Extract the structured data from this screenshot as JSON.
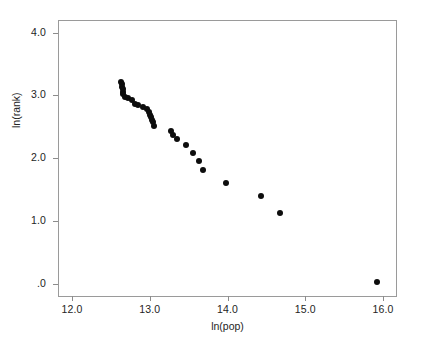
{
  "figure": {
    "background_color": "#ffffff",
    "frame_color": "#9a9a9a",
    "point_color": "#0d0d0d"
  },
  "chart_data": {
    "type": "scatter",
    "title": "",
    "xlabel": "ln(pop)",
    "ylabel": "ln(rank)",
    "xlim": [
      11.82,
      16.18
    ],
    "ylim": [
      -0.21,
      4.2
    ],
    "xticks": [
      12.0,
      13.0,
      14.0,
      15.0,
      16.0
    ],
    "xtick_labels": [
      "12.0",
      "13.0",
      "14.0",
      "15.0",
      "16.0"
    ],
    "yticks": [
      0.0,
      1.0,
      2.0,
      3.0,
      4.0
    ],
    "ytick_labels": [
      ".0",
      "1.0",
      "2.0",
      "3.0",
      "4.0"
    ],
    "grid": false,
    "legend": null,
    "marker": "filled-circle",
    "marker_size_px": 6,
    "n_points": 30,
    "x": [
      12.63,
      12.64,
      12.64,
      12.65,
      12.66,
      12.66,
      12.68,
      12.72,
      12.77,
      12.81,
      12.85,
      12.91,
      12.96,
      12.99,
      13.0,
      13.02,
      13.03,
      13.04,
      13.05,
      13.27,
      13.3,
      13.35,
      13.46,
      13.55,
      13.63,
      13.69,
      13.98,
      14.43,
      14.67,
      15.92
    ],
    "y": [
      3.22,
      3.18,
      3.14,
      3.1,
      3.06,
      3.02,
      2.98,
      2.96,
      2.92,
      2.87,
      2.85,
      2.81,
      2.78,
      2.73,
      2.69,
      2.65,
      2.61,
      2.57,
      2.52,
      2.43,
      2.37,
      2.31,
      2.21,
      2.09,
      1.96,
      1.81,
      1.61,
      1.4,
      1.12,
      0.03
    ],
    "points": [
      {
        "x": 12.63,
        "y": 3.22
      },
      {
        "x": 12.64,
        "y": 3.18
      },
      {
        "x": 12.64,
        "y": 3.14
      },
      {
        "x": 12.65,
        "y": 3.1
      },
      {
        "x": 12.66,
        "y": 3.06
      },
      {
        "x": 12.66,
        "y": 3.02
      },
      {
        "x": 12.68,
        "y": 2.98
      },
      {
        "x": 12.72,
        "y": 2.96
      },
      {
        "x": 12.77,
        "y": 2.92
      },
      {
        "x": 12.81,
        "y": 2.87
      },
      {
        "x": 12.85,
        "y": 2.85
      },
      {
        "x": 12.91,
        "y": 2.81
      },
      {
        "x": 12.96,
        "y": 2.78
      },
      {
        "x": 12.99,
        "y": 2.73
      },
      {
        "x": 13.0,
        "y": 2.69
      },
      {
        "x": 13.02,
        "y": 2.65
      },
      {
        "x": 13.03,
        "y": 2.61
      },
      {
        "x": 13.04,
        "y": 2.57
      },
      {
        "x": 13.05,
        "y": 2.52
      },
      {
        "x": 13.27,
        "y": 2.43
      },
      {
        "x": 13.3,
        "y": 2.37
      },
      {
        "x": 13.35,
        "y": 2.31
      },
      {
        "x": 13.46,
        "y": 2.21
      },
      {
        "x": 13.55,
        "y": 2.09
      },
      {
        "x": 13.63,
        "y": 1.96
      },
      {
        "x": 13.69,
        "y": 1.81
      },
      {
        "x": 13.98,
        "y": 1.61
      },
      {
        "x": 14.43,
        "y": 1.4
      },
      {
        "x": 14.67,
        "y": 1.12
      },
      {
        "x": 15.92,
        "y": 0.03
      }
    ]
  }
}
